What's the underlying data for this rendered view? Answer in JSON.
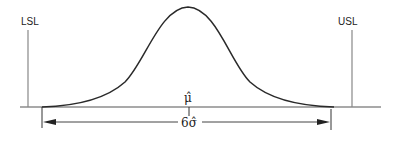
{
  "diagram": {
    "type": "process-capability-normal-curve",
    "labels": {
      "lsl": "LSL",
      "usl": "USL",
      "mean": "μ̂",
      "spread": "6σ̂"
    },
    "colors": {
      "line": "#2a2a2a",
      "spec_line": "#777777",
      "background": "#ffffff"
    }
  }
}
